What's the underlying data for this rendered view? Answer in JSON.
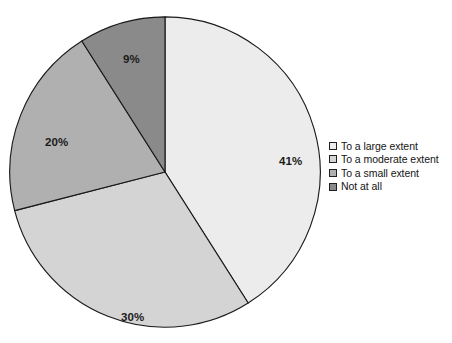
{
  "chart_data": {
    "type": "pie",
    "title": "",
    "subtitle": "",
    "xlabel": "",
    "ylabel": "",
    "grid": false,
    "legend_position": "right",
    "start_angle_deg": 0,
    "direction": "clockwise",
    "categories": [
      "To a large extent",
      "To a moderate extent",
      "To a small extent",
      "Not at all"
    ],
    "values": [
      41,
      30,
      20,
      9
    ],
    "value_unit": "%",
    "data_labels": [
      "41%",
      "30%",
      "20%",
      "9%"
    ],
    "slice_colors": [
      "#ececec",
      "#d4d4d4",
      "#b0b0b0",
      "#8a8a8a"
    ],
    "slice_outline_color": "#1a1a1a",
    "slices": [
      {
        "label": "To a large extent",
        "value": 41,
        "data_label": "41%",
        "color": "#ececec",
        "start_angle_deg": 0.0,
        "end_angle_deg": 147.6
      },
      {
        "label": "To a moderate extent",
        "value": 30,
        "data_label": "30%",
        "color": "#d4d4d4",
        "start_angle_deg": 147.6,
        "end_angle_deg": 255.6
      },
      {
        "label": "To a small extent",
        "value": 20,
        "data_label": "20%",
        "color": "#b0b0b0",
        "start_angle_deg": 255.6,
        "end_angle_deg": 327.6
      },
      {
        "label": "Not at all",
        "value": 9,
        "data_label": "9%",
        "color": "#8a8a8a",
        "start_angle_deg": 327.6,
        "end_angle_deg": 360.0
      }
    ]
  },
  "legend": {
    "items": [
      {
        "label": "To a large extent",
        "color": "#ececec"
      },
      {
        "label": "To a moderate extent",
        "color": "#d4d4d4"
      },
      {
        "label": "To a small extent",
        "color": "#b0b0b0"
      },
      {
        "label": "Not at all",
        "color": "#8a8a8a"
      }
    ]
  }
}
